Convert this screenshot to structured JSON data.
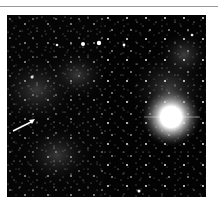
{
  "figure": {
    "panels": [
      {
        "id": "left",
        "description": "star field with nebulosity",
        "annotation": "arrow pointing to faint source"
      },
      {
        "id": "right",
        "description": "star field with bright saturated star",
        "annotation": "none"
      }
    ],
    "colors": {
      "background": "#ffffff",
      "sky": "#050505",
      "rule": "#9a9a9a",
      "star": "#ffffff"
    }
  }
}
